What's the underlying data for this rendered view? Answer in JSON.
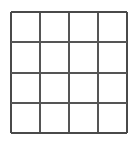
{
  "figure": {
    "name": "4x4-grid",
    "cell_label": ""
  },
  "canvas": {
    "width": 137,
    "height": 141,
    "background_color": "#ffffff"
  },
  "chart_data": {
    "type": "table",
    "title": "",
    "subtitle": "",
    "xlabel": "",
    "ylabel": "",
    "grid": true,
    "legend": null,
    "rows": 4,
    "columns": 4,
    "column_headers": [
      "",
      "",
      "",
      ""
    ],
    "row_headers": [
      "",
      "",
      "",
      ""
    ],
    "values": [
      [
        "",
        "",
        "",
        ""
      ],
      [
        "",
        "",
        "",
        ""
      ],
      [
        "",
        "",
        "",
        ""
      ],
      [
        "",
        "",
        "",
        ""
      ]
    ],
    "geometry": {
      "origin_x": 11,
      "origin_y": 12,
      "width": 116,
      "height": 121,
      "vertical_line_x": [
        0,
        29,
        58,
        87,
        116
      ],
      "horizontal_line_y": [
        0,
        30,
        61,
        91,
        121
      ]
    }
  },
  "style": {
    "line_color": "#555555",
    "outer_line_color": "#4a4a4a",
    "cell_fill": "#ffffff",
    "line_width": 2
  }
}
